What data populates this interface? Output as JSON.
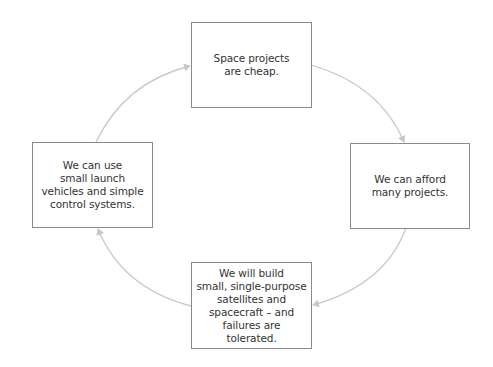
{
  "diagram": {
    "type": "cycle",
    "nodes": [
      {
        "id": "top",
        "text": "Space projects\nare cheap."
      },
      {
        "id": "right",
        "text": "We can afford\nmany projects."
      },
      {
        "id": "bottom",
        "text": "We will build\nsmall, single-purpose\nsatellites and\nspacecraft – and\nfailures are tolerated."
      },
      {
        "id": "left",
        "text": "We can use\nsmall launch\nvehicles and simple\ncontrol systems."
      }
    ],
    "edges": [
      {
        "from": "top",
        "to": "right"
      },
      {
        "from": "right",
        "to": "bottom"
      },
      {
        "from": "bottom",
        "to": "left"
      },
      {
        "from": "left",
        "to": "top"
      }
    ],
    "colors": {
      "box_border": "#8a8a8a",
      "arrow": "#c8c8c8",
      "text": "#333333"
    }
  }
}
